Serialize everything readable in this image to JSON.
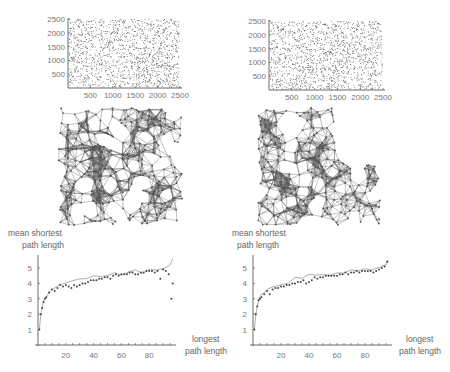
{
  "panels": {
    "top_left": {
      "x_ticks": [
        "500",
        "1000",
        "1500",
        "2000",
        "2500"
      ],
      "y_ticks": [
        "500",
        "1000",
        "1500",
        "2000",
        "2500"
      ]
    },
    "top_right": {
      "x_ticks": [
        "500",
        "1000",
        "1500",
        "2000",
        "2500"
      ],
      "y_ticks": [
        "500",
        "1000",
        "1500",
        "2000",
        "2500"
      ]
    },
    "bottom_left": {
      "ylabel_line1": "mean shortest",
      "ylabel_line2": "path length",
      "xlabel_line1": "longest",
      "xlabel_line2": "path length",
      "x_ticks": [
        "20",
        "40",
        "60",
        "80"
      ],
      "y_ticks": [
        "1",
        "2",
        "3",
        "4",
        "5"
      ]
    },
    "bottom_right": {
      "ylabel_line1": "mean shortest",
      "ylabel_line2": "path length",
      "xlabel_line1": "longest",
      "xlabel_line2": "path length",
      "x_ticks": [
        "20",
        "40",
        "60",
        "80"
      ],
      "y_ticks": [
        "1",
        "2",
        "3",
        "4",
        "5"
      ]
    }
  },
  "colors": {
    "axis": "#444444",
    "points": "#555555",
    "network": "#5a5a5a",
    "line": "#999999"
  },
  "chart_data": [
    {
      "type": "scatter",
      "title": "",
      "xlabel": "",
      "ylabel": "",
      "xlim": [
        0,
        2500
      ],
      "ylim": [
        0,
        2500
      ],
      "x_ticks": [
        500,
        1000,
        1500,
        2000,
        2500
      ],
      "y_ticks": [
        500,
        1000,
        1500,
        2000,
        2500
      ],
      "note": "uniform random node positions (~2000 points), with small gaps"
    },
    {
      "type": "scatter",
      "title": "",
      "xlabel": "",
      "ylabel": "",
      "xlim": [
        0,
        2500
      ],
      "ylim": [
        0,
        2500
      ],
      "x_ticks": [
        500,
        1000,
        1500,
        2000,
        2500
      ],
      "y_ticks": [
        500,
        1000,
        1500,
        2000,
        2500
      ],
      "note": "uniform random node positions (~2000 points)"
    },
    {
      "type": "diagram",
      "note": "random geometric network graph, square-shaped dense mesh"
    },
    {
      "type": "diagram",
      "note": "random geometric network graph, mesh with indented upper-right region"
    },
    {
      "type": "scatter",
      "title": "",
      "xlabel": "longest path length",
      "ylabel": "mean shortest path length",
      "xlim": [
        0,
        100
      ],
      "ylim": [
        0,
        5.7
      ],
      "x_ticks": [
        20,
        40,
        60,
        80
      ],
      "y_ticks": [
        1,
        2,
        3,
        4,
        5
      ],
      "series": [
        {
          "name": "points",
          "x": [
            1,
            2,
            3,
            4,
            5,
            6,
            8,
            10,
            12,
            14,
            16,
            18,
            20,
            22,
            24,
            26,
            28,
            30,
            32,
            34,
            36,
            38,
            40,
            42,
            44,
            46,
            48,
            50,
            52,
            54,
            56,
            58,
            60,
            62,
            64,
            66,
            68,
            70,
            72,
            74,
            76,
            78,
            80,
            82,
            84,
            86,
            88,
            90,
            92,
            94,
            96,
            97
          ],
          "y": [
            1.0,
            2.0,
            2.4,
            2.8,
            3.0,
            3.1,
            3.4,
            3.6,
            3.5,
            3.7,
            3.9,
            3.8,
            3.9,
            3.8,
            3.7,
            3.9,
            3.8,
            3.9,
            4.0,
            4.0,
            4.1,
            4.2,
            4.2,
            4.2,
            4.3,
            4.3,
            4.4,
            4.4,
            4.3,
            4.5,
            4.6,
            4.5,
            4.6,
            4.6,
            4.6,
            4.7,
            4.7,
            4.6,
            4.6,
            4.7,
            4.7,
            4.8,
            4.8,
            4.8,
            4.7,
            4.8,
            4.3,
            4.9,
            4.8,
            4.6,
            3.0,
            4.0
          ]
        },
        {
          "name": "line",
          "x": [
            1,
            2,
            4,
            6,
            8,
            10,
            15,
            20,
            25,
            30,
            35,
            40,
            45,
            50,
            55,
            60,
            65,
            70,
            75,
            80,
            85,
            90,
            95,
            97
          ],
          "y": [
            1.0,
            2.0,
            2.9,
            3.2,
            3.5,
            3.6,
            3.9,
            4.0,
            4.1,
            4.3,
            4.4,
            4.5,
            4.4,
            4.5,
            4.6,
            4.6,
            4.7,
            4.8,
            4.7,
            4.9,
            4.9,
            5.0,
            5.2,
            5.5
          ]
        }
      ]
    },
    {
      "type": "scatter",
      "title": "",
      "xlabel": "longest path length",
      "ylabel": "mean shortest path length",
      "xlim": [
        0,
        100
      ],
      "ylim": [
        0,
        5.7
      ],
      "x_ticks": [
        20,
        40,
        60,
        80
      ],
      "y_ticks": [
        1,
        2,
        3,
        4,
        5
      ],
      "series": [
        {
          "name": "points",
          "x": [
            1,
            2,
            3,
            4,
            5,
            6,
            8,
            10,
            12,
            14,
            16,
            18,
            20,
            22,
            24,
            26,
            28,
            30,
            32,
            34,
            36,
            38,
            40,
            42,
            44,
            46,
            48,
            50,
            52,
            54,
            56,
            58,
            60,
            62,
            64,
            66,
            68,
            70,
            72,
            74,
            76,
            78,
            80,
            82,
            84,
            86,
            88,
            90,
            92,
            94,
            96
          ],
          "y": [
            1.0,
            2.0,
            2.5,
            2.9,
            3.0,
            3.1,
            3.3,
            3.5,
            3.3,
            3.6,
            3.7,
            3.7,
            3.8,
            3.8,
            3.9,
            3.9,
            4.0,
            4.0,
            4.1,
            4.1,
            4.2,
            4.0,
            4.1,
            4.2,
            4.4,
            4.3,
            4.4,
            4.4,
            4.5,
            4.5,
            4.5,
            4.5,
            4.5,
            4.6,
            4.6,
            4.7,
            4.6,
            4.7,
            4.7,
            4.8,
            4.7,
            4.8,
            4.8,
            4.8,
            4.8,
            4.7,
            4.8,
            4.9,
            5.0,
            5.1,
            5.4
          ]
        },
        {
          "name": "line",
          "x": [
            1,
            2,
            4,
            6,
            8,
            10,
            15,
            20,
            25,
            30,
            35,
            40,
            45,
            50,
            55,
            60,
            65,
            70,
            75,
            80,
            85,
            90,
            95,
            96
          ],
          "y": [
            1.0,
            2.0,
            2.9,
            3.2,
            3.4,
            3.6,
            3.8,
            3.9,
            4.1,
            4.3,
            4.4,
            4.6,
            4.5,
            4.5,
            4.6,
            4.6,
            4.7,
            4.8,
            4.8,
            4.9,
            4.9,
            5.0,
            5.2,
            5.5
          ]
        }
      ]
    }
  ]
}
